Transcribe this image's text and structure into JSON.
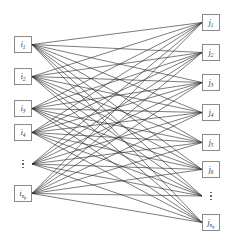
{
  "figure": {
    "type": "bipartite-graph",
    "width": 230,
    "height": 247,
    "background_color": "#ffffff",
    "edge_color": "#2a2a2a",
    "node_border_color": "#8a8a8a",
    "node_fill_color": "#ffffff"
  },
  "left_column": {
    "name": "source-nodes",
    "x": 14,
    "box_width": 18,
    "box_height": 17,
    "nodes": [
      {
        "id": "i1",
        "label": "i",
        "sub": "1",
        "subsub": "",
        "y": 36,
        "kind": "node"
      },
      {
        "id": "i2",
        "label": "i",
        "sub": "2",
        "subsub": "",
        "y": 68,
        "kind": "node"
      },
      {
        "id": "i3",
        "label": "i",
        "sub": "3",
        "subsub": "",
        "y": 100,
        "kind": "node"
      },
      {
        "id": "i4",
        "label": "i",
        "sub": "4",
        "subsub": "",
        "y": 124,
        "kind": "node"
      },
      {
        "id": "i-ellipsis",
        "label": "",
        "sub": "",
        "subsub": "",
        "y": 156,
        "kind": "ellipsis"
      },
      {
        "id": "inp",
        "label": "i",
        "sub": "n",
        "subsub": "p",
        "y": 185,
        "kind": "node"
      }
    ]
  },
  "right_column": {
    "name": "target-nodes",
    "x": 202,
    "box_width": 18,
    "box_height": 17,
    "nodes": [
      {
        "id": "j1",
        "label": "j",
        "sub": "1",
        "subsub": "",
        "y": 14,
        "kind": "node"
      },
      {
        "id": "j2",
        "label": "j",
        "sub": "2",
        "subsub": "",
        "y": 44,
        "kind": "node"
      },
      {
        "id": "j3",
        "label": "j",
        "sub": "3",
        "subsub": "",
        "y": 74,
        "kind": "node"
      },
      {
        "id": "j4",
        "label": "j",
        "sub": "4",
        "subsub": "",
        "y": 104,
        "kind": "node"
      },
      {
        "id": "j5",
        "label": "j",
        "sub": "5",
        "subsub": "",
        "y": 134,
        "kind": "node"
      },
      {
        "id": "j6",
        "label": "j",
        "sub": "6",
        "subsub": "",
        "y": 161,
        "kind": "node"
      },
      {
        "id": "j-ellipsis",
        "label": "",
        "sub": "",
        "subsub": "",
        "y": 188,
        "kind": "ellipsis"
      },
      {
        "id": "jnq",
        "label": "j",
        "sub": "n",
        "subsub": "q",
        "y": 214,
        "kind": "node"
      }
    ]
  },
  "edges": {
    "name": "bipartite-edges",
    "style": "complete",
    "stroke": "#2a2a2a",
    "stroke_width": 0.62,
    "left_anchor_side": "right",
    "right_anchor_side": "left",
    "left_anchor_y": [
      44.5,
      76.5,
      108.5,
      132.5,
      164,
      193.5
    ],
    "right_anchor_y": [
      22.5,
      52.5,
      82.5,
      112.5,
      142.5,
      169.5,
      196,
      222.5
    ],
    "left_anchor_x": 32,
    "right_anchor_x": 202
  }
}
